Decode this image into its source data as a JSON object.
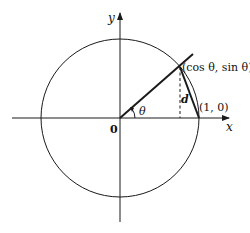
{
  "diagram": {
    "type": "unit-circle",
    "axes": {
      "x_label": "x",
      "y_label": "y",
      "origin_label": "0"
    },
    "angle_label": "θ",
    "point_on_circle_label": "(cos θ, sin θ)",
    "point_on_axis_label": "(1, 0)",
    "chord_label": "d",
    "colors": {
      "stroke": "#1a1a1a",
      "background": "#ffffff"
    }
  }
}
